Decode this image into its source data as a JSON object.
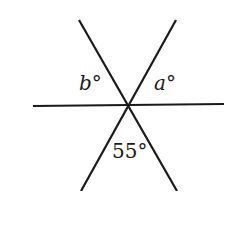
{
  "diagram": {
    "type": "intersecting-lines-angles",
    "lines": [
      {
        "name": "diagonal-descending",
        "x1": 79,
        "y1": 20,
        "x2": 177,
        "y2": 191
      },
      {
        "name": "diagonal-ascending",
        "x1": 176,
        "y1": 20,
        "x2": 81,
        "y2": 191
      },
      {
        "name": "horizontal",
        "x1": 33,
        "y1": 106,
        "x2": 224,
        "y2": 104
      }
    ],
    "intersection": {
      "x": 129,
      "y": 106
    },
    "labels": {
      "b": {
        "var": "b",
        "degree": "°"
      },
      "a": {
        "var": "a",
        "degree": "°"
      },
      "bottom": {
        "text": "55°"
      }
    },
    "colors": {
      "line": "#1a1a1a",
      "background": "#ffffff"
    }
  }
}
